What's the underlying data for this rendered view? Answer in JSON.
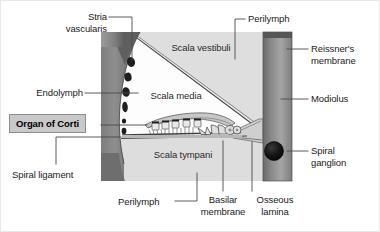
{
  "figure": {
    "width": 380,
    "height": 232,
    "background_color": "#ffffff",
    "border_color": "#e8e8e8"
  },
  "palette": {
    "spiral_ligament_dark": "#6f6f6f",
    "spiral_ligament_light": "#9a9a9a",
    "modiolus_dark": "#5d5d5d",
    "modiolus_light": "#a8a8a8",
    "perilymph_fill": "#dcdcdc",
    "scala_media_fill": "#fefefe",
    "outline": "#3a3a3a",
    "stria_spot": "#222222",
    "spiral_ganglion": "#141414",
    "leader_line": "#4a4a4a",
    "text": "#1b1b1b",
    "highlight_box_fill": "#c9c9c9",
    "highlight_box_border": "#8d8d8d"
  },
  "callout_labels": [
    {
      "id": "stria-vascularis",
      "text": "Stria\nvascularis",
      "align": "right",
      "x": 48,
      "y": 10,
      "w": 58
    },
    {
      "id": "endolymph",
      "text": "Endolymph",
      "align": "right",
      "x": 24,
      "y": 86,
      "w": 82
    },
    {
      "id": "organ-of-corti",
      "text": "Organ of Corti",
      "align": "left",
      "x": 8,
      "y": 113,
      "w": 88,
      "boxed": true
    },
    {
      "id": "spiral-ligament",
      "text": "Spiral ligament",
      "align": "left",
      "x": 11,
      "y": 168,
      "w": 86
    },
    {
      "id": "perilymph-bottom",
      "text": "Perilymph",
      "align": "left",
      "x": 115,
      "y": 196,
      "w": 56
    },
    {
      "id": "basilar-membrane",
      "text": "Basilar\nmembrane",
      "align": "center",
      "x": 196,
      "y": 194,
      "w": 54
    },
    {
      "id": "osseous-lamina",
      "text": "Osseous\nlamina",
      "align": "center",
      "x": 250,
      "y": 194,
      "w": 50
    },
    {
      "id": "perilymph-top",
      "text": "Perilymph",
      "align": "left",
      "x": 247,
      "y": 12,
      "w": 56
    },
    {
      "id": "reissners-membrane",
      "text": "Reissner's\nmembrane",
      "align": "left",
      "x": 310,
      "y": 42,
      "w": 68
    },
    {
      "id": "modiolus",
      "text": "Modiolus",
      "align": "left",
      "x": 310,
      "y": 93,
      "w": 56
    },
    {
      "id": "spiral-ganglion",
      "text": "Spiral\nganglion",
      "align": "left",
      "x": 310,
      "y": 144,
      "w": 56
    }
  ],
  "inner_labels": [
    {
      "id": "scala-vestibuli",
      "text": "Scala vestibuli",
      "x": 160,
      "y": 42,
      "w": 76
    },
    {
      "id": "scala-media",
      "text": "Scala media",
      "x": 143,
      "y": 90,
      "w": 66
    },
    {
      "id": "scala-tympani",
      "text": "Scala tympani",
      "x": 146,
      "y": 148,
      "w": 72
    }
  ],
  "structures": [
    {
      "id": "spiral-ligament-band",
      "description": "Vertical gray gradient band on left forming the outer cochlear wall"
    },
    {
      "id": "modiolus-band",
      "description": "Vertical gray gradient band on right, the central bony core"
    },
    {
      "id": "scala-vestibuli-chamber",
      "description": "Upper perilymph-filled wedge-shaped chamber"
    },
    {
      "id": "scala-media-chamber",
      "description": "Central triangular endolymph-filled duct"
    },
    {
      "id": "scala-tympani-chamber",
      "description": "Lower perilymph-filled wedge-shaped chamber"
    },
    {
      "id": "reissners-membrane-line",
      "description": "Thin double diagonal line dividing scala vestibuli from scala media"
    },
    {
      "id": "basilar-membrane-line",
      "description": "Horizontal membrane dividing scala media from scala tympani"
    },
    {
      "id": "osseous-spiral-lamina",
      "description": "Bony shelf projecting from the modiolus"
    },
    {
      "id": "organ-of-corti-detail",
      "description": "Hair cells, pillar cells and tectorial membrane on the basilar membrane"
    },
    {
      "id": "stria-vascularis-spots",
      "description": "Five dark oval blood-vessel profiles along the inner edge of the spiral ligament"
    },
    {
      "id": "spiral-ganglion-dot",
      "description": "Dark round cluster of neuron cell bodies inside the modiolus"
    }
  ]
}
